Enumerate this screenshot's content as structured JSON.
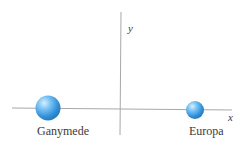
{
  "diagram": {
    "axes": {
      "x_label": "x",
      "y_label": "y",
      "color": "#a0a0a0"
    },
    "bodies": [
      {
        "name": "Ganymede",
        "color": "#4aa3e8",
        "size": "large"
      },
      {
        "name": "Europa",
        "color": "#4aa3e8",
        "size": "small"
      }
    ]
  }
}
